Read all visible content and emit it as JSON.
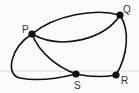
{
  "graph": {
    "nodes": [
      {
        "id": "P",
        "label": "P",
        "x": 32,
        "y": 34,
        "label_x": 22,
        "label_y": 33
      },
      {
        "id": "Q",
        "label": "Q",
        "x": 120,
        "y": 15,
        "label_x": 123,
        "label_y": 13
      },
      {
        "id": "R",
        "label": "R",
        "x": 116,
        "y": 75,
        "label_x": 121,
        "label_y": 84
      },
      {
        "id": "S",
        "label": "S",
        "x": 76,
        "y": 74,
        "label_x": 74,
        "label_y": 89
      }
    ],
    "edges": [
      {
        "from": "P",
        "to": "Q",
        "kind": "upper-arc"
      },
      {
        "from": "P",
        "to": "Q",
        "kind": "lower-arc"
      },
      {
        "from": "Q",
        "to": "R"
      },
      {
        "from": "S",
        "to": "R"
      },
      {
        "from": "P",
        "to": "S",
        "kind": "inner-curve"
      },
      {
        "from": "P",
        "to": "S",
        "kind": "outer-loop"
      }
    ],
    "colors": {
      "edge": "#111111",
      "node": "#111111",
      "rule": "#d8d8d8"
    }
  }
}
